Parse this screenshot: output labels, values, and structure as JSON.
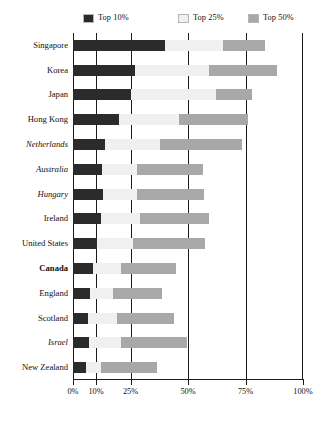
{
  "legend": {
    "position": "top",
    "items": [
      {
        "label": "Top 10%",
        "key": "top10",
        "color": "#2b2b2b"
      },
      {
        "label": "Top 25%",
        "key": "top25",
        "color": "#f0f0f0"
      },
      {
        "label": "Top 50%",
        "key": "top50",
        "color": "#a8a8a8"
      }
    ]
  },
  "axis": {
    "ticks": [
      {
        "label": "0%",
        "value": 0
      },
      {
        "label": "10%",
        "value": 10
      },
      {
        "label": "25%",
        "value": 25
      },
      {
        "label": "50%",
        "value": 50
      },
      {
        "label": "75%",
        "value": 75
      },
      {
        "label": "100%",
        "value": 100
      }
    ]
  },
  "chart_data": {
    "type": "bar",
    "orientation": "horizontal",
    "title": "",
    "subtitle": "",
    "xlabel": "",
    "ylabel": "",
    "xlim": [
      0,
      100
    ],
    "grid": true,
    "gridlines": [
      10,
      25,
      50,
      75
    ],
    "legend_position": "top",
    "categories": [
      "Singapore",
      "Korea",
      "Japan",
      "Hong Kong",
      "Netherlands",
      "Australia",
      "Hungary",
      "Ireland",
      "United States",
      "Canada",
      "England",
      "Scotland",
      "Israel",
      "New Zealand"
    ],
    "category_styles": [
      "normal",
      "normal",
      "normal",
      "normal",
      "italic",
      "italic",
      "italic",
      "normal",
      "normal",
      "bold",
      "normal",
      "normal",
      "italic",
      "normal"
    ],
    "series": [
      {
        "name": "Top 10%",
        "color": "#2b2b2b",
        "values": [
          40,
          27,
          25,
          20,
          14,
          12.5,
          13,
          12,
          10.5,
          8.5,
          7.5,
          6.5,
          7,
          5.5
        ]
      },
      {
        "name": "Top 25%",
        "color": "#f0f0f0",
        "values": [
          65,
          59,
          62,
          46,
          38,
          28,
          28,
          29,
          26,
          21,
          17.5,
          19,
          21,
          12
        ]
      },
      {
        "name": "Top 50%",
        "color": "#a8a8a8",
        "values": [
          83.5,
          88.5,
          78,
          76,
          73.5,
          56.5,
          57,
          59,
          57.5,
          45,
          38.5,
          44,
          49.5,
          36.5
        ]
      }
    ],
    "rows": [
      {
        "category": "Singapore",
        "style": "normal",
        "top10": 40,
        "top25": 65,
        "top50": 83.5,
        "top50_start": 65,
        "top25_start": 40
      },
      {
        "category": "Korea",
        "style": "normal",
        "top10": 27,
        "top25": 59,
        "top50": 88.5,
        "top50_start": 59,
        "top25_start": 27
      },
      {
        "category": "Japan",
        "style": "normal",
        "top10": 25,
        "top25": 62,
        "top50": 78,
        "top50_start": 62,
        "top25_start": 25
      },
      {
        "category": "Hong Kong",
        "style": "normal",
        "top10": 20,
        "top25": 46,
        "top50": 76,
        "top50_start": 46,
        "top25_start": 20
      },
      {
        "category": "Netherlands",
        "style": "italic",
        "top10": 14,
        "top25": 38,
        "top50": 73.5,
        "top50_start": 38,
        "top25_start": 14
      },
      {
        "category": "Australia",
        "style": "italic",
        "top10": 12.5,
        "top25": 28,
        "top50": 56.5,
        "top50_start": 28,
        "top25_start": 12.5
      },
      {
        "category": "Hungary",
        "style": "italic",
        "top10": 13,
        "top25": 28,
        "top50": 57,
        "top50_start": 28,
        "top25_start": 13
      },
      {
        "category": "Ireland",
        "style": "normal",
        "top10": 12,
        "top25": 29,
        "top50": 59,
        "top50_start": 29,
        "top25_start": 12
      },
      {
        "category": "United States",
        "style": "normal",
        "top10": 10.5,
        "top25": 26,
        "top50": 57.5,
        "top50_start": 26,
        "top25_start": 10.5
      },
      {
        "category": "Canada",
        "style": "bold",
        "top10": 8.5,
        "top25": 21,
        "top50": 45,
        "top50_start": 21,
        "top25_start": 8.5
      },
      {
        "category": "England",
        "style": "normal",
        "top10": 7.5,
        "top25": 17.5,
        "top50": 38.5,
        "top50_start": 17.5,
        "top25_start": 7.5
      },
      {
        "category": "Scotland",
        "style": "normal",
        "top10": 6.5,
        "top25": 19,
        "top50": 44,
        "top50_start": 19,
        "top25_start": 6.5
      },
      {
        "category": "Israel",
        "style": "italic",
        "top10": 7,
        "top25": 21,
        "top50": 49.5,
        "top50_start": 21,
        "top25_start": 7
      },
      {
        "category": "New Zealand",
        "style": "normal",
        "top10": 5.5,
        "top25": 12,
        "top50": 36.5,
        "top50_start": 12,
        "top25_start": 5.5
      }
    ]
  }
}
